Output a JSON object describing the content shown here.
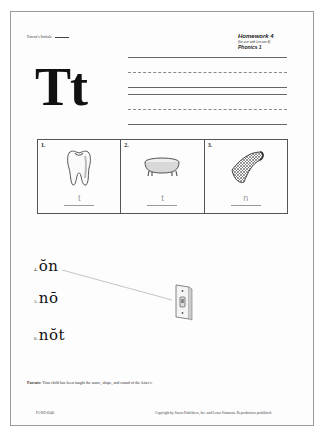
{
  "header": {
    "initials_label": "Parent's Initials",
    "homework_title": "Homework 4",
    "homework_subtitle": "(for use with Lesson 4)",
    "program": "Phonics 1"
  },
  "letter": {
    "display": "Tt"
  },
  "writing_lines": [
    {
      "style": "solid",
      "y": 57
    },
    {
      "style": "dashed",
      "y": 72
    },
    {
      "style": "solid",
      "y": 87
    },
    {
      "style": "solid",
      "y": 94
    },
    {
      "style": "dashed",
      "y": 109
    },
    {
      "style": "solid",
      "y": 124
    }
  ],
  "picture_items": [
    {
      "number": "1.",
      "picture": "tooth",
      "answer": "t"
    },
    {
      "number": "2.",
      "picture": "bathtub",
      "answer": "t"
    },
    {
      "number": "3.",
      "picture": "net",
      "answer": "n"
    }
  ],
  "word_items": [
    {
      "number": "4.",
      "word": "ŏn"
    },
    {
      "number": "5.",
      "word": "nō"
    },
    {
      "number": "6.",
      "word": "nŏt"
    }
  ],
  "matching": {
    "picture": "light-switch",
    "connected_item": "4."
  },
  "note": {
    "label": "Parents:",
    "text": "Your child has been taught the name, shape, and sound of the letter t."
  },
  "footer": {
    "code": "P1-HO-0340",
    "copyright": "Copyright by Saxon Publishers, Inc. and Lorna Simmons. Reproduction prohibited."
  }
}
